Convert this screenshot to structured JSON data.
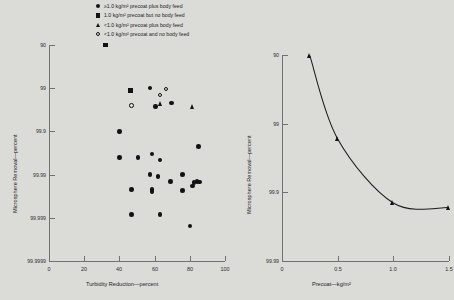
{
  "legend": {
    "entries": [
      {
        "marker": "filled-circle",
        "label": "≥1.0 kg/m² precoat plus body feed"
      },
      {
        "marker": "filled-square",
        "label": "1.0 kg/m² precoat but no body feed"
      },
      {
        "marker": "filled-triangle",
        "label": "<1.0 kg/m² precoat plus body feed"
      },
      {
        "marker": "open-circle",
        "label": "<1.0 kg/m² precoat and no body feed"
      }
    ]
  },
  "chart_data": [
    {
      "type": "scatter",
      "title": "",
      "xlabel": "Turbidity Reduction—percent",
      "ylabel": "Microsphere Removal—percent",
      "xlim": [
        0,
        100
      ],
      "xticks": [
        0,
        20,
        40,
        60,
        80,
        100
      ],
      "xticklabels": [
        "0",
        "20",
        "40",
        "60",
        "80",
        "100"
      ],
      "yticklabels": [
        "90",
        "99",
        "99.9",
        "99.99",
        "99.999",
        "99.9999"
      ],
      "yscale": "log-removal",
      "grid": false,
      "legend_position": "above-plot",
      "series": [
        {
          "name": "≥1.0 kg/m² precoat plus body feed",
          "marker": "filled-circle",
          "points": [
            [
              60.5,
              99.62
            ],
            [
              57.5,
              99.0
            ],
            [
              69.5,
              99.55
            ],
            [
              40.0,
              99.9
            ],
            [
              85.0,
              99.955
            ],
            [
              40.0,
              99.975
            ],
            [
              58.5,
              99.97
            ],
            [
              50.5,
              99.975
            ],
            [
              63.0,
              99.978
            ],
            [
              57.5,
              99.99
            ],
            [
              62.0,
              99.991
            ],
            [
              76.0,
              99.99
            ],
            [
              69.0,
              99.993
            ],
            [
              82.5,
              99.9935
            ],
            [
              84.0,
              99.993
            ],
            [
              85.5,
              99.9932
            ],
            [
              58.5,
              99.9955
            ],
            [
              58.5,
              99.996
            ],
            [
              47.0,
              99.9955
            ],
            [
              76.0,
              99.9957
            ],
            [
              81.5,
              99.9945
            ],
            [
              47.0,
              99.9988
            ],
            [
              63.0,
              99.9988
            ],
            [
              80.0,
              99.99935
            ]
          ]
        },
        {
          "name": "1.0 kg/m² precoat but no body feed",
          "marker": "filled-square",
          "points": [
            [
              32.0,
              90.0
            ],
            [
              46.5,
              99.1
            ]
          ]
        },
        {
          "name": "<1.0 kg/m² precoat plus body feed",
          "marker": "filled-triangle",
          "points": [
            [
              63.5,
              99.55
            ],
            [
              82.0,
              99.62
            ]
          ]
        },
        {
          "name": "<1.0 kg/m² precoat and no body feed",
          "marker": "open-circle",
          "points": [
            [
              63.0,
              99.3
            ],
            [
              66.5,
              99.05
            ],
            [
              47.0,
              99.6
            ]
          ]
        }
      ]
    },
    {
      "type": "line",
      "title": "",
      "xlabel": "Precoat—kg/m²",
      "ylabel": "Microsphere Removal—percent",
      "xlim": [
        0,
        1.5
      ],
      "xticks": [
        0,
        0.5,
        1.0,
        1.5
      ],
      "xticklabels": [
        "0",
        "0.5",
        "1.0",
        "1.5"
      ],
      "yticklabels": [
        "90",
        "99",
        "99.9",
        "99.99"
      ],
      "yscale": "log-removal",
      "grid": false,
      "marker": "filled-triangle",
      "x": [
        0.25,
        0.5,
        1.0,
        1.5
      ],
      "y": [
        90.2,
        99.4,
        99.93,
        99.94
      ],
      "series": [
        {
          "name": "precoat response",
          "x": [
            0.25,
            0.5,
            1.0,
            1.5
          ],
          "y": [
            90.2,
            99.4,
            99.93,
            99.94
          ]
        }
      ]
    }
  ]
}
